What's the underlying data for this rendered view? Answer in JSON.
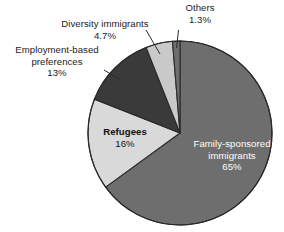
{
  "chart_data": {
    "type": "pie",
    "title": "",
    "subtitle": "",
    "xlabel": "",
    "ylabel": "",
    "legend_position": "none",
    "grid": false,
    "units": "percent",
    "start_angle_deg": 0,
    "direction": "clockwise",
    "categories": [
      "Family-sponsored immigrants",
      "Refugees",
      "Employment-based preferences",
      "Diversity immigrants",
      "Others"
    ],
    "values": [
      65,
      16,
      13,
      4.7,
      1.3
    ],
    "value_labels": [
      "65%",
      "16%",
      "13%",
      "4.7%",
      "1.3%"
    ],
    "colors": [
      "#6e6e6e",
      "#d9d9d9",
      "#3a3a3a",
      "#c9c9c9",
      "#6e6e6e"
    ],
    "slices": [
      {
        "name": "Family-sponsored immigrants",
        "label_line1": "Family-sponsored",
        "label_line2": "immigrants",
        "value": 65,
        "value_label": "65%",
        "color": "#6e6e6e",
        "text_color": "#ffffff",
        "label_placement": "inside"
      },
      {
        "name": "Refugees",
        "label_line1": "Refugees",
        "label_line2": "",
        "value": 16,
        "value_label": "16%",
        "color": "#d9d9d9",
        "text_color": "#111111",
        "label_placement": "inside"
      },
      {
        "name": "Employment-based preferences",
        "label_line1": "Employment-based",
        "label_line2": "preferences",
        "value": 13,
        "value_label": "13%",
        "color": "#3a3a3a",
        "text_color": "#1c1c1c",
        "label_placement": "outside"
      },
      {
        "name": "Diversity immigrants",
        "label_line1": "Diversity immigrants",
        "label_line2": "",
        "value": 4.7,
        "value_label": "4.7%",
        "color": "#c9c9c9",
        "text_color": "#1c1c1c",
        "label_placement": "outside"
      },
      {
        "name": "Others",
        "label_line1": "Others",
        "label_line2": "",
        "value": 1.3,
        "value_label": "1.3%",
        "color": "#6e6e6e",
        "text_color": "#1c1c1c",
        "label_placement": "outside"
      }
    ],
    "geometry": {
      "center_x": 180,
      "center_y": 133,
      "radius": 92
    },
    "style": {
      "background": "#ffffff",
      "outline_color": "#2a2a2a",
      "leader_line_color": "#2a2a2a"
    }
  }
}
